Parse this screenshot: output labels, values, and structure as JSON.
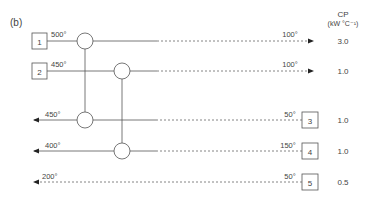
{
  "figure_label": "(b)",
  "cp_header": {
    "line1": "CP",
    "line2": "(kW °C⁻¹)"
  },
  "hot_streams": [
    {
      "id": "1",
      "supply_temp": "500°",
      "target_temp": "100°",
      "cp": "3.0"
    },
    {
      "id": "2",
      "supply_temp": "450°",
      "target_temp": "100°",
      "cp": "1.0"
    }
  ],
  "cold_streams": [
    {
      "id": "3",
      "supply_temp": "50°",
      "target_temp": "450°",
      "cp": "1.0"
    },
    {
      "id": "4",
      "supply_temp": "150°",
      "target_temp": "400°",
      "cp": "1.0"
    },
    {
      "id": "5",
      "supply_temp": "50°",
      "target_temp": "200°",
      "cp": "0.5"
    }
  ],
  "matches": [
    {
      "hot": "1",
      "cold": "3"
    },
    {
      "hot": "2",
      "cold": "4"
    }
  ]
}
